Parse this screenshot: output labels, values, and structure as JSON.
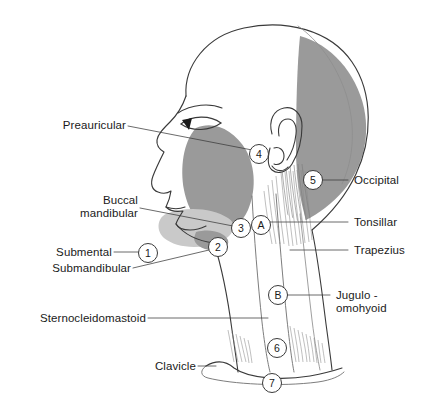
{
  "figure": {
    "background_color": "#ffffff",
    "ink_color": "#3a3a3a",
    "shade_color": "#9a9a9a",
    "shade_light_color": "#c9c9c9",
    "width": 423,
    "height": 415
  },
  "labels_left": [
    {
      "id": "preauricular",
      "text": "Preauricular",
      "lines": [
        "Preauricular"
      ]
    },
    {
      "id": "buccal-mandibular",
      "text": "Buccal mandibular",
      "lines": [
        "Buccal",
        "mandibular"
      ]
    },
    {
      "id": "submental",
      "text": "Submental",
      "lines": [
        "Submental"
      ]
    },
    {
      "id": "submandibular",
      "text": "Submandibular",
      "lines": [
        "Submandibular"
      ]
    },
    {
      "id": "sternocleidomastoid",
      "text": "Sternocleidomastoid",
      "lines": [
        "Sternocleidomastoid"
      ]
    },
    {
      "id": "clavicle",
      "text": "Clavicle",
      "lines": [
        "Clavicle"
      ]
    }
  ],
  "labels_right": [
    {
      "id": "occipital",
      "text": "Occipital",
      "lines": [
        "Occipital"
      ]
    },
    {
      "id": "tonsillar",
      "text": "Tonsillar",
      "lines": [
        "Tonsillar"
      ]
    },
    {
      "id": "trapezius",
      "text": "Trapezius",
      "lines": [
        "Trapezius"
      ]
    },
    {
      "id": "jugulo-omohyoid",
      "text": "Jugulo - omohyoid",
      "lines": [
        "Jugulo -",
        "omohyoid"
      ]
    }
  ],
  "markers": [
    {
      "id": "marker-1",
      "label": "1",
      "x": 148,
      "y": 253
    },
    {
      "id": "marker-2",
      "label": "2",
      "x": 218,
      "y": 247
    },
    {
      "id": "marker-3",
      "label": "3",
      "x": 241,
      "y": 228
    },
    {
      "id": "marker-4",
      "label": "4",
      "x": 259,
      "y": 154
    },
    {
      "id": "marker-5",
      "label": "5",
      "x": 313,
      "y": 180
    },
    {
      "id": "marker-6",
      "label": "6",
      "x": 277,
      "y": 348
    },
    {
      "id": "marker-7",
      "label": "7",
      "x": 272,
      "y": 383
    },
    {
      "id": "marker-a",
      "label": "A",
      "x": 261,
      "y": 225
    },
    {
      "id": "marker-b",
      "label": "B",
      "x": 278,
      "y": 295
    }
  ],
  "label_text": {
    "preauricular": "Preauricular",
    "buccal_line1": "Buccal",
    "buccal_line2": "mandibular",
    "submental": "Submental",
    "submandibular": "Submandibular",
    "sternocleidomastoid": "Sternocleidomastoid",
    "clavicle": "Clavicle",
    "occipital": "Occipital",
    "tonsillar": "Tonsillar",
    "trapezius": "Trapezius",
    "jugulo_line1": "Jugulo -",
    "jugulo_line2": "omohyoid"
  },
  "marker_text": {
    "m1": "1",
    "m2": "2",
    "m3": "3",
    "m4": "4",
    "m5": "5",
    "m6": "6",
    "m7": "7",
    "mA": "A",
    "mB": "B"
  }
}
